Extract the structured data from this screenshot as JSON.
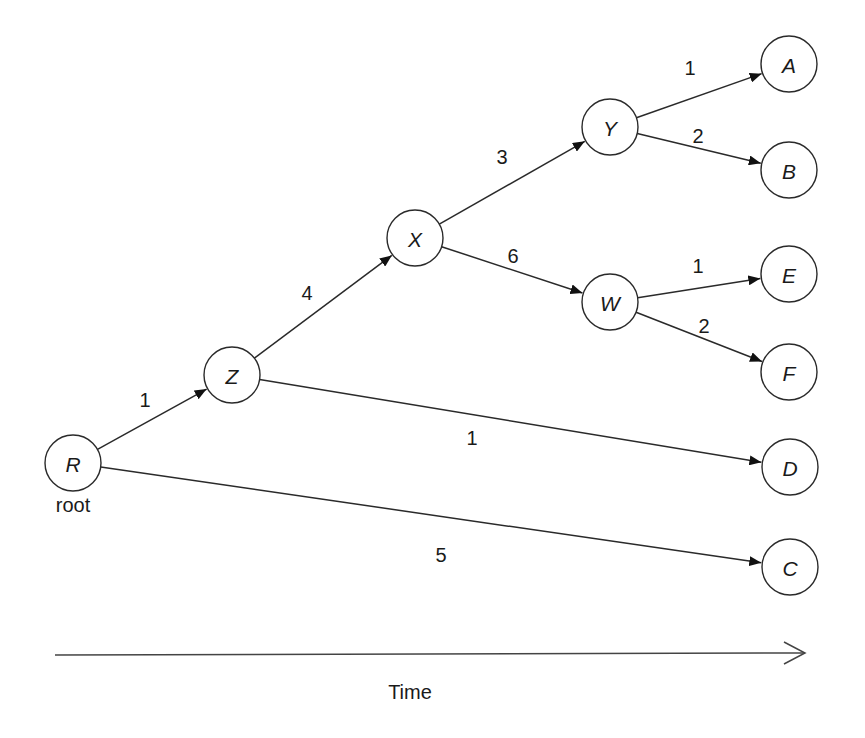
{
  "diagram": {
    "type": "rooted-tree-over-time",
    "root_label": "root",
    "axis_label": "Time",
    "nodes": [
      {
        "id": "R",
        "label": "R",
        "x": 73,
        "y": 463
      },
      {
        "id": "Z",
        "label": "Z",
        "x": 232,
        "y": 375
      },
      {
        "id": "X",
        "label": "X",
        "x": 415,
        "y": 238
      },
      {
        "id": "Y",
        "label": "Y",
        "x": 610,
        "y": 127
      },
      {
        "id": "W",
        "label": "W",
        "x": 610,
        "y": 302
      },
      {
        "id": "A",
        "label": "A",
        "x": 789,
        "y": 64
      },
      {
        "id": "B",
        "label": "B",
        "x": 789,
        "y": 170
      },
      {
        "id": "E",
        "label": "E",
        "x": 789,
        "y": 274
      },
      {
        "id": "F",
        "label": "F",
        "x": 789,
        "y": 372
      },
      {
        "id": "D",
        "label": "D",
        "x": 790,
        "y": 467
      },
      {
        "id": "C",
        "label": "C",
        "x": 790,
        "y": 567
      }
    ],
    "edges": [
      {
        "from": "R",
        "to": "Z",
        "weight": "1",
        "lx": 145,
        "ly": 400
      },
      {
        "from": "Z",
        "to": "X",
        "weight": "4",
        "lx": 307,
        "ly": 293
      },
      {
        "from": "X",
        "to": "Y",
        "weight": "3",
        "lx": 502,
        "ly": 157
      },
      {
        "from": "X",
        "to": "W",
        "weight": "6",
        "lx": 513,
        "ly": 256
      },
      {
        "from": "Y",
        "to": "A",
        "weight": "1",
        "lx": 690,
        "ly": 68
      },
      {
        "from": "Y",
        "to": "B",
        "weight": "2",
        "lx": 698,
        "ly": 136
      },
      {
        "from": "W",
        "to": "E",
        "weight": "1",
        "lx": 698,
        "ly": 266
      },
      {
        "from": "W",
        "to": "F",
        "weight": "2",
        "lx": 704,
        "ly": 326
      },
      {
        "from": "Z",
        "to": "D",
        "weight": "1",
        "lx": 472,
        "ly": 438
      },
      {
        "from": "R",
        "to": "C",
        "weight": "5",
        "lx": 441,
        "ly": 555
      }
    ]
  }
}
